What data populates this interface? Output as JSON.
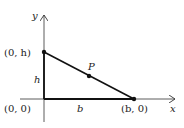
{
  "diagram": {
    "type": "coordinate-triangle",
    "axes": {
      "x_label": "x",
      "y_label": "y"
    },
    "points": {
      "top": {
        "label": "(0, h)",
        "x": 44,
        "y": 52
      },
      "origin": {
        "label": "(0, 0)",
        "x": 44,
        "y": 99
      },
      "right": {
        "label": "(b, 0)",
        "x": 134,
        "y": 99
      },
      "mid": {
        "label": "P",
        "x": 89,
        "y": 76
      }
    },
    "segment_labels": {
      "height": "h",
      "base": "b"
    },
    "colors": {
      "line": "#111111",
      "axis": "#333333",
      "text": "#222222"
    }
  }
}
